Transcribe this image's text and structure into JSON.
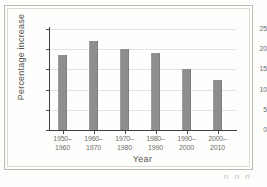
{
  "figure": {
    "caption_marks": "n n  n"
  },
  "chart_data": {
    "type": "bar",
    "title": "",
    "xlabel": "Year",
    "ylabel": "Percentage increase",
    "categories": [
      "1950–\n1960",
      "1960–\n1970",
      "1970–\n1980",
      "1980–\n1990",
      "1990–\n2000",
      "2000–\n2010"
    ],
    "category_lines": [
      [
        "1950–",
        "1960"
      ],
      [
        "1960–",
        "1970"
      ],
      [
        "1970–",
        "1980"
      ],
      [
        "1980–",
        "1990"
      ],
      [
        "1990–",
        "2000"
      ],
      [
        "2000–",
        "2010"
      ]
    ],
    "values": [
      18.5,
      22.0,
      20.0,
      19.0,
      15.2,
      12.4
    ],
    "ylim": [
      0,
      25
    ],
    "yticks": [
      0,
      5,
      10,
      15,
      20,
      25
    ],
    "ytick_labels": [
      "0",
      "5",
      "10",
      "15",
      "20",
      "25"
    ],
    "grid": true,
    "legend": false,
    "bar_color": "#8e8e8c",
    "grid_color": "#e2e2e0",
    "axis_color": "#3d3d3d"
  }
}
